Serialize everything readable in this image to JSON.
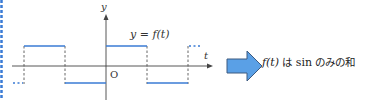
{
  "figure": {
    "graph": {
      "y_axis_label": "y",
      "x_axis_label": "t",
      "origin_label": "O",
      "function_label": "y = f(t)",
      "waveform": "square wave (odd function)",
      "colors": {
        "signal": "#3a7bd5",
        "axis": "#444444",
        "dashed": "#555555",
        "left_border": "#3a7bd5"
      }
    },
    "arrow": {
      "direction": "right",
      "fill": "#5aa0e6",
      "stroke": "#3c5a80"
    },
    "caption": {
      "func": "f(t)",
      "particle": " は ",
      "word": "sin",
      "rest": " のみの和"
    }
  }
}
